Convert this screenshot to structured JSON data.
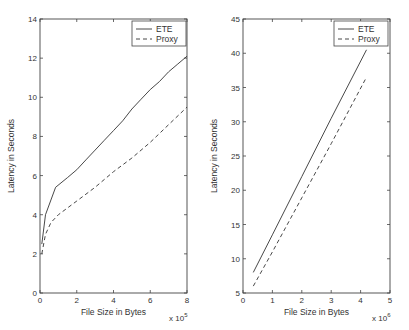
{
  "chart_data": [
    {
      "type": "line",
      "title": "",
      "xlabel": "File Size in Bytes",
      "ylabel": "Latency in Seconds",
      "x_multiplier": "x 10^5",
      "x_multiplier_base": "x 10",
      "x_multiplier_exp": "5",
      "xlim": [
        0,
        8
      ],
      "ylim": [
        0,
        14
      ],
      "xticks": [
        0,
        2,
        4,
        6,
        8
      ],
      "yticks": [
        0,
        2,
        4,
        6,
        8,
        10,
        12,
        14
      ],
      "grid": false,
      "legend_position": "upper right",
      "series": [
        {
          "name": "ETE",
          "style": "solid",
          "x": [
            0.1,
            0.3,
            0.85,
            1.5,
            2.0,
            2.5,
            3.0,
            3.5,
            4.0,
            4.5,
            5.0,
            5.5,
            6.0,
            6.5,
            7.0,
            7.5,
            8.0
          ],
          "y": [
            2.5,
            4.0,
            5.4,
            5.9,
            6.3,
            6.8,
            7.3,
            7.8,
            8.3,
            8.8,
            9.4,
            9.9,
            10.4,
            10.8,
            11.3,
            11.7,
            12.1
          ]
        },
        {
          "name": "Proxy",
          "style": "dashed",
          "x": [
            0.1,
            0.3,
            0.6,
            1.0,
            2.0,
            3.0,
            4.0,
            5.0,
            6.0,
            7.0,
            8.0
          ],
          "y": [
            2.0,
            3.0,
            3.6,
            4.0,
            4.7,
            5.4,
            6.2,
            6.9,
            7.7,
            8.6,
            9.5
          ]
        }
      ]
    },
    {
      "type": "line",
      "title": "",
      "xlabel": "File Size in Bytes",
      "ylabel": "Latency in Seconds",
      "x_multiplier": "x 10^6",
      "x_multiplier_base": "x 10",
      "x_multiplier_exp": "6",
      "xlim": [
        0,
        5
      ],
      "ylim": [
        5,
        45
      ],
      "xticks": [
        0,
        1,
        2,
        3,
        4,
        5
      ],
      "yticks": [
        5,
        10,
        15,
        20,
        25,
        30,
        35,
        40,
        45
      ],
      "grid": false,
      "legend_position": "upper right",
      "series": [
        {
          "name": "ETE",
          "style": "solid",
          "x": [
            0.35,
            1.0,
            2.0,
            3.0,
            4.2
          ],
          "y": [
            8.0,
            13.5,
            22.0,
            30.5,
            40.5
          ]
        },
        {
          "name": "Proxy",
          "style": "dashed",
          "x": [
            0.35,
            1.0,
            2.0,
            3.0,
            4.2
          ],
          "y": [
            6.0,
            11.0,
            18.9,
            26.8,
            36.5
          ]
        }
      ]
    }
  ]
}
